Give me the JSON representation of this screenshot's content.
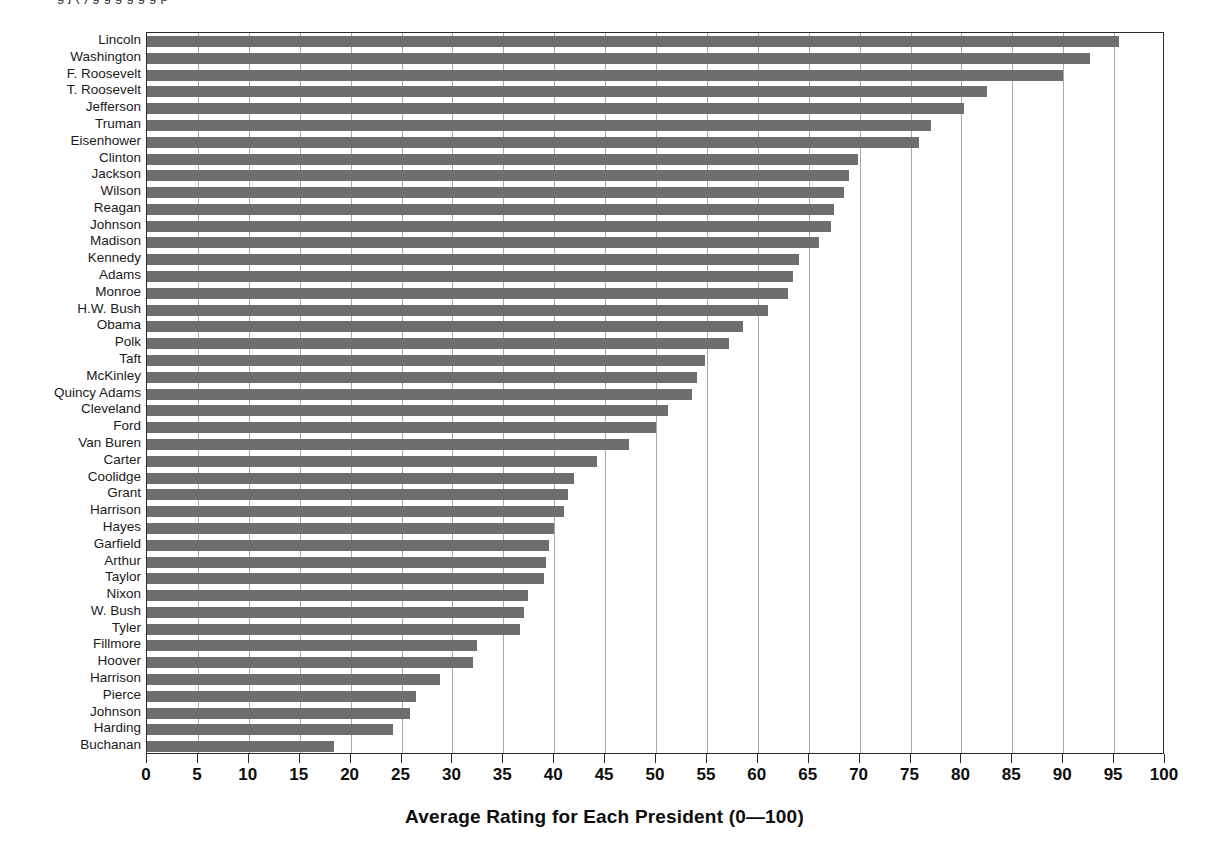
{
  "top_caption": "g    j  (    )   g  g g   g  g   g   p",
  "chart_data": {
    "type": "bar",
    "orientation": "horizontal",
    "title": "",
    "xlabel": "Average Rating for Each President (0—100)",
    "ylabel": "",
    "xlim": [
      0,
      100
    ],
    "xticks": [
      0,
      5,
      10,
      15,
      20,
      25,
      30,
      35,
      40,
      45,
      50,
      55,
      60,
      65,
      70,
      75,
      80,
      85,
      90,
      95,
      100
    ],
    "xtick_labels": [
      "0",
      "5",
      "10",
      "15",
      "20",
      "25",
      "30",
      "35",
      "40",
      "45",
      "50",
      "55",
      "60",
      "65",
      "70",
      "75",
      "80",
      "85",
      "90",
      "95",
      "100"
    ],
    "grid": "vertical",
    "legend": "none",
    "bar_color": "#6e6e6e",
    "categories": [
      "Lincoln",
      "Washington",
      "F. Roosevelt",
      "T. Roosevelt",
      "Jefferson",
      "Truman",
      "Eisenhower",
      "Clinton",
      "Jackson",
      "Wilson",
      "Reagan",
      "Johnson",
      "Madison",
      "Kennedy",
      "Adams",
      "Monroe",
      "H.W. Bush",
      "Obama",
      "Polk",
      "Taft",
      "McKinley",
      "Quincy Adams",
      "Cleveland",
      "Ford",
      "Van Buren",
      "Carter",
      "Coolidge",
      "Grant",
      "Harrison",
      "Hayes",
      "Garfield",
      "Arthur",
      "Taylor",
      "Nixon",
      "W. Bush",
      "Tyler",
      "Fillmore",
      "Hoover",
      "Harrison",
      "Pierce",
      "Johnson",
      "Harding",
      "Buchanan"
    ],
    "values": [
      95.5,
      92.6,
      90.0,
      82.5,
      80.3,
      77.0,
      75.8,
      69.8,
      69.0,
      68.5,
      67.5,
      67.2,
      66.0,
      64.0,
      63.5,
      63.0,
      61.0,
      58.5,
      57.2,
      54.8,
      54.0,
      53.5,
      51.2,
      50.0,
      47.3,
      44.2,
      41.9,
      41.4,
      41.0,
      40.0,
      39.5,
      39.2,
      39.0,
      37.4,
      37.0,
      36.6,
      32.4,
      32.0,
      28.8,
      26.4,
      25.8,
      24.2,
      18.4
    ]
  },
  "ylabels": [
    "Lincoln",
    "Washington",
    "F. Roosevelt",
    "T. Roosevelt",
    "Jefferson",
    "Truman",
    "Eisenhower",
    "Clinton",
    "Jackson",
    "Wilson",
    "Reagan",
    "Johnson",
    "Madison",
    "Kennedy",
    "Adams",
    "Monroe",
    "H.W. Bush",
    "Obama",
    "Polk",
    "Taft",
    "McKinley",
    "Quincy Adams",
    "Cleveland",
    "Ford",
    "Van Buren",
    "Carter",
    "Coolidge",
    "Grant",
    "Harrison",
    "Hayes",
    "Garfield",
    "Arthur",
    "Taylor",
    "Nixon",
    "W. Bush",
    "Tyler",
    "Fillmore",
    "Hoover",
    "Harrison",
    "Pierce",
    "Johnson",
    "Harding",
    "Buchanan"
  ],
  "axis_title": "Average Rating for Each President (0—100)"
}
